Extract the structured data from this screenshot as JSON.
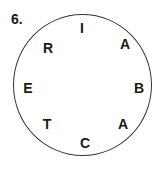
{
  "puzzle": {
    "number": "6.",
    "letters": [
      {
        "char": "I",
        "x": 82,
        "y": 28
      },
      {
        "char": "A",
        "x": 125,
        "y": 44
      },
      {
        "char": "B",
        "x": 139,
        "y": 88
      },
      {
        "char": "A",
        "x": 123,
        "y": 124
      },
      {
        "char": "C",
        "x": 85,
        "y": 143
      },
      {
        "char": "T",
        "x": 47,
        "y": 124
      },
      {
        "char": "E",
        "x": 28,
        "y": 88
      },
      {
        "char": "R",
        "x": 48,
        "y": 48
      }
    ]
  }
}
